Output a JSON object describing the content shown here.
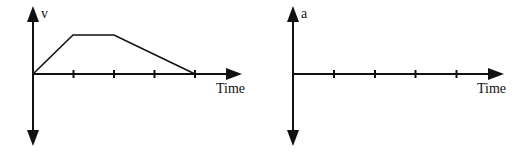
{
  "graphs": [
    {
      "id": "velocity-time",
      "y_label": "v",
      "x_label": "Time",
      "origin": [
        33,
        74
      ],
      "tick_spacing": 40.5,
      "ticks": 4,
      "curve_points": [
        [
          33,
          74
        ],
        [
          73,
          35
        ],
        [
          114,
          35
        ],
        [
          195,
          74
        ]
      ]
    },
    {
      "id": "acceleration-time",
      "y_label": "a",
      "x_label": "Time",
      "origin": [
        293,
        74
      ],
      "tick_spacing": 40.75,
      "ticks": 4,
      "curve_points": []
    }
  ],
  "colors": {
    "stroke": "#111111",
    "background": "#ffffff"
  }
}
